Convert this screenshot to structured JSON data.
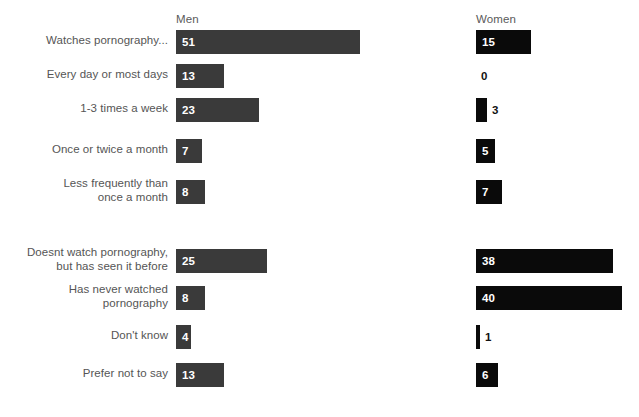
{
  "chart_data": {
    "type": "bar",
    "title": "",
    "subtitle": "",
    "xlabel": "",
    "ylabel": "",
    "orientation": "horizontal",
    "grid": false,
    "legend_position": "top-as-column-headers",
    "value_unit": "%",
    "xlim": [
      0,
      51
    ],
    "px_per_unit": 3.62,
    "series": [
      {
        "name": "Men",
        "color": "#3a3a3a",
        "values": [
          51,
          13,
          23,
          7,
          8,
          25,
          8,
          4,
          13
        ]
      },
      {
        "name": "Women",
        "color": "#0a0a0a",
        "values": [
          15,
          0,
          3,
          5,
          7,
          38,
          40,
          1,
          6
        ]
      }
    ],
    "categories": [
      "Watches pornography...",
      "Every day or most days",
      "1-3 times a week",
      "Once or twice a month",
      "Less frequently than\nonce a month",
      "Doesnt watch pornography,\nbut has seen it before",
      "Has never watched\npornography",
      "Don't know",
      "Prefer not to say"
    ],
    "groups": [
      {
        "id": "frequency-group",
        "start_index": 0,
        "count": 5
      },
      {
        "id": "non-viewing-group",
        "start_index": 5,
        "count": 4
      }
    ]
  },
  "headers": {
    "men": "Men",
    "women": "Women"
  },
  "rows": [
    {
      "label": "Watches pornography...",
      "lines": 1,
      "top": 30,
      "men": {
        "value": "51",
        "width": 184,
        "label_outside": false
      },
      "women": {
        "value": "15",
        "width": 55,
        "label_outside": false
      }
    },
    {
      "label": "Every day or most days",
      "lines": 1,
      "top": 64,
      "men": {
        "value": "13",
        "width": 48,
        "label_outside": false
      },
      "women": {
        "value": "0",
        "width": 0,
        "label_outside": true
      }
    },
    {
      "label": "1-3 times a week",
      "lines": 1,
      "top": 98,
      "men": {
        "value": "23",
        "width": 83,
        "label_outside": false
      },
      "women": {
        "value": "3",
        "width": 11,
        "label_outside": true
      }
    },
    {
      "label": "Once or twice a month",
      "lines": 1,
      "top": 139,
      "men": {
        "value": "7",
        "width": 26,
        "label_outside": false
      },
      "women": {
        "value": "5",
        "width": 19,
        "label_outside": false
      }
    },
    {
      "label": "Less frequently than\nonce a month",
      "lines": 2,
      "top": 180,
      "men": {
        "value": "8",
        "width": 29,
        "label_outside": false
      },
      "women": {
        "value": "7",
        "width": 26,
        "label_outside": false
      }
    },
    {
      "label": "Doesnt watch pornography,\nbut has seen it before",
      "lines": 2,
      "top": 249,
      "men": {
        "value": "25",
        "width": 91,
        "label_outside": false
      },
      "women": {
        "value": "38",
        "width": 137,
        "label_outside": false
      }
    },
    {
      "label": "Has never watched\npornography",
      "lines": 2,
      "top": 286,
      "men": {
        "value": "8",
        "width": 29,
        "label_outside": false
      },
      "women": {
        "value": "40",
        "width": 146,
        "label_outside": false
      }
    },
    {
      "label": "Don't know",
      "lines": 1,
      "top": 325,
      "men": {
        "value": "4",
        "width": 15,
        "label_outside": false
      },
      "women": {
        "value": "1",
        "width": 4,
        "label_outside": true
      }
    },
    {
      "label": "Prefer not to say",
      "lines": 1,
      "top": 363,
      "men": {
        "value": "13",
        "width": 48,
        "label_outside": false
      },
      "women": {
        "value": "6",
        "width": 22,
        "label_outside": false
      }
    }
  ],
  "layout": {
    "men_bar_x": 176,
    "women_bar_x": 476,
    "bar_height": 24,
    "label_right_edge": 168
  }
}
